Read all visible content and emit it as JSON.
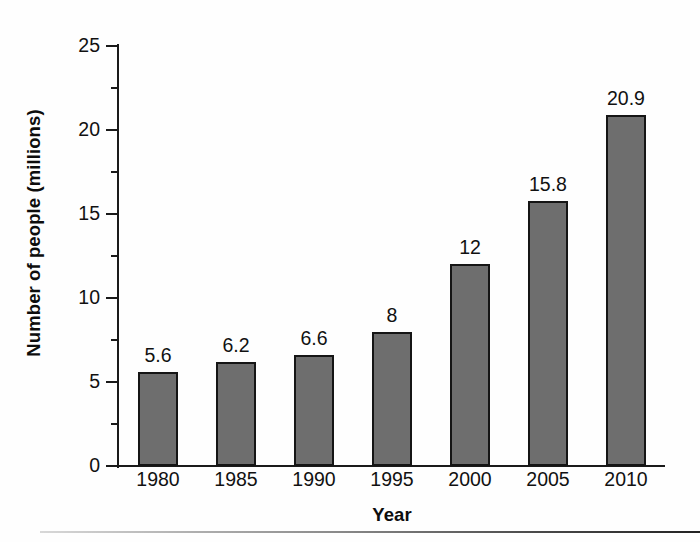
{
  "chart_data": {
    "type": "bar",
    "title": "",
    "xlabel": "Year",
    "ylabel": "Number of people (millions)",
    "categories": [
      "1980",
      "1985",
      "1990",
      "1995",
      "2000",
      "2005",
      "2010"
    ],
    "values": [
      5.6,
      6.2,
      6.6,
      8,
      12,
      15.8,
      20.9
    ],
    "value_labels": [
      "5.6",
      "6.2",
      "6.6",
      "8",
      "12",
      "15.8",
      "20.9"
    ],
    "ylim": [
      0,
      25
    ],
    "y_major_ticks": [
      0,
      5,
      10,
      15,
      20,
      25
    ],
    "y_tick_labels": [
      "0",
      "5",
      "10",
      "15",
      "20",
      "25"
    ],
    "y_minor_ticks": [
      2.5,
      7.5,
      12.5,
      17.5,
      22.5
    ],
    "grid": false,
    "legend": false,
    "bar_color": "#6e6e6e",
    "bar_border_color": "#151515",
    "axis_color": "#1a1a1a",
    "text_color": "#111111",
    "background": "#ffffff"
  },
  "figure": {
    "bottom_rule": ""
  }
}
